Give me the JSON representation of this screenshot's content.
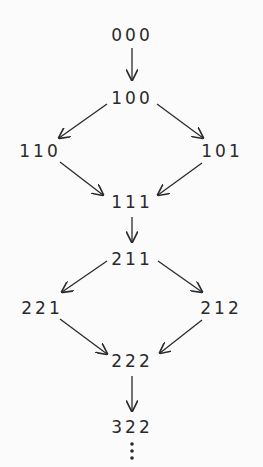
{
  "diagram": {
    "nodes": [
      {
        "id": "000",
        "label": "000",
        "x": 132,
        "y": 35
      },
      {
        "id": "100",
        "label": "100",
        "x": 132,
        "y": 98
      },
      {
        "id": "110",
        "label": "110",
        "x": 40,
        "y": 151
      },
      {
        "id": "101",
        "label": "101",
        "x": 222,
        "y": 151
      },
      {
        "id": "111",
        "label": "111",
        "x": 132,
        "y": 202
      },
      {
        "id": "211",
        "label": "211",
        "x": 132,
        "y": 259
      },
      {
        "id": "221",
        "label": "221",
        "x": 42,
        "y": 308
      },
      {
        "id": "212",
        "label": "212",
        "x": 221,
        "y": 308
      },
      {
        "id": "222",
        "label": "222",
        "x": 132,
        "y": 361
      },
      {
        "id": "322",
        "label": "322",
        "x": 132,
        "y": 427
      }
    ],
    "edges": [
      [
        "000",
        "100"
      ],
      [
        "100",
        "110"
      ],
      [
        "100",
        "101"
      ],
      [
        "110",
        "111"
      ],
      [
        "101",
        "111"
      ],
      [
        "111",
        "211"
      ],
      [
        "211",
        "221"
      ],
      [
        "211",
        "212"
      ],
      [
        "221",
        "222"
      ],
      [
        "212",
        "222"
      ],
      [
        "222",
        "322"
      ]
    ],
    "continuation": "⋮"
  }
}
